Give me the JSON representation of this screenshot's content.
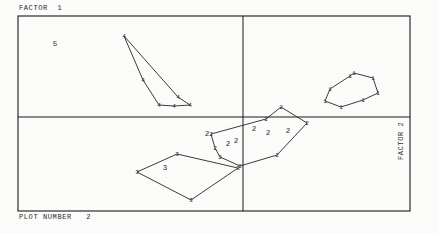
{
  "figure": {
    "top_left_label": "FACTOR  1",
    "bottom_left_label": "PLOT NUMBER   2",
    "right_vertical_label": "FACTOR 2",
    "stray_label_5": "5",
    "line_color": "#1a1a1a",
    "text_color": "#2a2a2a",
    "background_color": "#fdfdfc"
  },
  "chart_data": {
    "type": "scatter",
    "title": "",
    "subtitle": "",
    "xlabel": "FACTOR 2",
    "ylabel": "FACTOR 1",
    "xlim": [
      -1,
      1
    ],
    "ylim": [
      -1,
      1
    ],
    "grid": false,
    "legend": "none",
    "axes": {
      "frame": {
        "left": 18,
        "top": 16,
        "right": 410,
        "bottom": 211
      },
      "vertical_axis_x": 243,
      "horizontal_axis_y": 117,
      "note": "Two reference axes divide the frame into four quadrants; no tick marks or numeric tick labels are printed."
    },
    "annotations": [
      {
        "text": "FACTOR  1",
        "x": 19,
        "y": 9,
        "role": "top-left-axis-caption"
      },
      {
        "text": "PLOT NUMBER   2",
        "x": 19,
        "y": 218,
        "role": "bottom-caption"
      },
      {
        "text": "FACTOR 2",
        "x": 402,
        "y": 185,
        "role": "right-vertical-axis-caption",
        "rotation": -90
      },
      {
        "text": "5",
        "x": 55,
        "y": 46,
        "role": "group-label"
      },
      {
        "text": "2",
        "x": 207,
        "y": 136,
        "role": "group-label"
      },
      {
        "text": "2",
        "x": 228,
        "y": 146,
        "role": "group-label"
      },
      {
        "text": "2",
        "x": 236,
        "y": 143,
        "role": "group-label"
      },
      {
        "text": "2",
        "x": 254,
        "y": 131,
        "role": "group-label"
      },
      {
        "text": "2",
        "x": 268,
        "y": 135,
        "role": "group-label"
      },
      {
        "text": "2",
        "x": 288,
        "y": 133,
        "role": "group-label"
      },
      {
        "text": "3",
        "x": 165,
        "y": 170,
        "role": "group-label"
      }
    ],
    "series": [
      {
        "name": "1",
        "marker_label": "1",
        "closed": true,
        "points": [
          {
            "x": 325,
            "y": 101
          },
          {
            "x": 330,
            "y": 89
          },
          {
            "x": 350,
            "y": 76
          },
          {
            "x": 354,
            "y": 73
          },
          {
            "x": 373,
            "y": 78
          },
          {
            "x": 378,
            "y": 93
          },
          {
            "x": 363,
            "y": 100
          },
          {
            "x": 341,
            "y": 107
          }
        ]
      },
      {
        "name": "2",
        "marker_label": "2",
        "closed": true,
        "points": [
          {
            "x": 211,
            "y": 134
          },
          {
            "x": 266,
            "y": 119
          },
          {
            "x": 281,
            "y": 107
          },
          {
            "x": 307,
            "y": 123
          },
          {
            "x": 277,
            "y": 155
          },
          {
            "x": 240,
            "y": 166
          },
          {
            "x": 220,
            "y": 157
          },
          {
            "x": 215,
            "y": 148
          }
        ]
      },
      {
        "name": "3",
        "marker_label": "3",
        "closed": true,
        "points": [
          {
            "x": 137,
            "y": 172
          },
          {
            "x": 177,
            "y": 154
          },
          {
            "x": 238,
            "y": 168
          },
          {
            "x": 191,
            "y": 200
          }
        ]
      },
      {
        "name": "4",
        "marker_label": "4",
        "closed": true,
        "points": [
          {
            "x": 124,
            "y": 36
          },
          {
            "x": 143,
            "y": 80
          },
          {
            "x": 159,
            "y": 105
          },
          {
            "x": 174,
            "y": 106
          },
          {
            "x": 190,
            "y": 105
          },
          {
            "x": 178,
            "y": 97
          }
        ]
      }
    ]
  }
}
